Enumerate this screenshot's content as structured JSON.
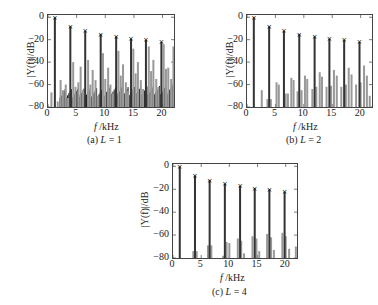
{
  "chart_data": [
    {
      "type": "bar",
      "title": "",
      "caption": "(a) L = 1",
      "xlabel": "f /kHz",
      "ylabel": "|Y(f)|/dB",
      "xlim": [
        0,
        22
      ],
      "ylim": [
        -80,
        2
      ],
      "xticks": [
        0,
        5,
        10,
        15,
        20
      ],
      "yticks": [
        0,
        -20,
        -40,
        -60,
        -80
      ],
      "harmonics": {
        "x": [
          1.2,
          3.9,
          6.5,
          9.2,
          11.9,
          14.5,
          17.1,
          19.8
        ],
        "values": [
          0,
          -8,
          -12,
          -15,
          -17,
          -19,
          -20,
          -22
        ]
      },
      "distortion_bars": {
        "x": [
          0.6,
          1.7,
          2.2,
          2.6,
          3.1,
          3.5,
          4.4,
          4.8,
          5.3,
          5.7,
          6.1,
          7.0,
          7.4,
          7.8,
          8.3,
          8.7,
          9.6,
          10.0,
          10.5,
          10.9,
          11.3,
          12.3,
          12.7,
          13.1,
          13.6,
          14.0,
          14.9,
          15.3,
          15.7,
          16.2,
          16.6,
          17.6,
          18.0,
          18.4,
          18.9,
          19.3,
          20.2,
          20.6,
          21.0,
          21.5,
          21.9
        ],
        "values": [
          -67,
          -75,
          -56,
          -65,
          -60,
          -72,
          -40,
          -62,
          -58,
          -44,
          -65,
          -38,
          -60,
          -47,
          -56,
          -70,
          -32,
          -55,
          -45,
          -60,
          -68,
          -30,
          -52,
          -42,
          -58,
          -66,
          -28,
          -50,
          -40,
          -56,
          -64,
          -26,
          -48,
          -38,
          -55,
          -62,
          -24,
          -46,
          -45,
          -55,
          -26
        ]
      }
    },
    {
      "type": "bar",
      "title": "",
      "caption": "(b) L = 2",
      "xlabel": "f /kHz",
      "ylabel": "|Y(f)|/dB",
      "xlim": [
        0,
        22
      ],
      "ylim": [
        -80,
        2
      ],
      "xticks": [
        0,
        5,
        10,
        15,
        20
      ],
      "yticks": [
        0,
        -20,
        -40,
        -60,
        -80
      ],
      "harmonics": {
        "x": [
          1.2,
          3.9,
          6.5,
          9.2,
          11.9,
          14.5,
          17.1,
          19.8
        ],
        "values": [
          0,
          -8,
          -12,
          -15,
          -17,
          -19,
          -20,
          -22
        ]
      },
      "distortion_bars": {
        "x": [
          2.6,
          3.6,
          4.2,
          5.2,
          5.6,
          6.8,
          7.2,
          7.8,
          8.2,
          8.9,
          9.6,
          10.2,
          10.6,
          11.5,
          12.2,
          12.8,
          13.2,
          14.0,
          14.8,
          15.3,
          15.8,
          16.6,
          17.4,
          17.9,
          18.4,
          19.2,
          20.0,
          20.6,
          21.1,
          21.6
        ],
        "values": [
          -65,
          -73,
          -73,
          -58,
          -60,
          -68,
          -68,
          -54,
          -56,
          -66,
          -65,
          -52,
          -55,
          -64,
          -62,
          -49,
          -53,
          -62,
          -61,
          -47,
          -52,
          -62,
          -60,
          -45,
          -51,
          -60,
          -58,
          -43,
          -52,
          -70
        ]
      }
    },
    {
      "type": "bar",
      "title": "",
      "caption": "(c) L = 4",
      "xlabel": "f /kHz",
      "ylabel": "|Y(f)|/dB",
      "xlim": [
        0,
        22
      ],
      "ylim": [
        -80,
        2
      ],
      "xticks": [
        0,
        5,
        10,
        15,
        20
      ],
      "yticks": [
        0,
        -20,
        -40,
        -60,
        -80
      ],
      "harmonics": {
        "x": [
          1.2,
          3.9,
          6.5,
          9.2,
          11.9,
          14.5,
          17.1,
          19.8
        ],
        "values": [
          0,
          -8,
          -12,
          -15,
          -17,
          -19,
          -20,
          -22
        ]
      },
      "distortion_bars": {
        "x": [
          3.6,
          4.2,
          6.2,
          6.8,
          8.9,
          9.5,
          10.0,
          11.5,
          12.1,
          12.6,
          14.1,
          14.8,
          15.3,
          16.7,
          17.4,
          17.9,
          19.4,
          20.0,
          20.6,
          21.8
        ],
        "values": [
          -74,
          -74,
          -69,
          -69,
          -78,
          -66,
          -67,
          -63,
          -65,
          -76,
          -61,
          -63,
          -74,
          -59,
          -62,
          -73,
          -58,
          -61,
          -72,
          -70
        ]
      }
    }
  ],
  "panels": [
    {
      "caption_prefix": "(a) ",
      "caption_var": "L",
      "caption_suffix": " = 1"
    },
    {
      "caption_prefix": "(b) ",
      "caption_var": "L",
      "caption_suffix": " = 2"
    },
    {
      "caption_prefix": "(c) ",
      "caption_var": "L",
      "caption_suffix": " = 4"
    }
  ],
  "labels": {
    "ylabel": "|Y(f)|/dB",
    "xlabel_var": "f",
    "xlabel_unit": " /kHz"
  },
  "colors": {
    "harmonic": "#333333",
    "distortion_light": "#999999",
    "distortion_dark": "#222222",
    "axis": "#444444"
  }
}
